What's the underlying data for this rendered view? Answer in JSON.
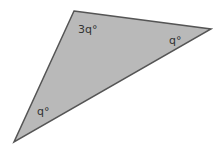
{
  "diagram": {
    "type": "triangle",
    "fill": "#b9b9b9",
    "stroke": "#555555",
    "vertices": {
      "top": [
        74,
        11
      ],
      "right": [
        211,
        29
      ],
      "bottom_left": [
        14,
        142
      ]
    },
    "angles": {
      "top": "3q°",
      "right": "q°",
      "bottom_left": "q°"
    }
  }
}
